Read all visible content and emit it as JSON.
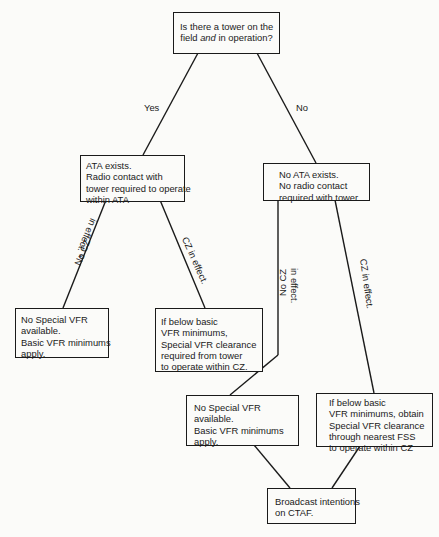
{
  "diagram": {
    "type": "decision-flowchart",
    "nodes": {
      "question": {
        "lines": [
          "Is there a tower on the",
          "field ",
          "and",
          " in operation?"
        ]
      },
      "yes_result": {
        "lines": [
          "ATA exists.",
          "Radio contact with",
          "tower required to operate",
          "within ATA"
        ]
      },
      "no_result": {
        "lines": [
          "No ATA exists.",
          "No radio contact",
          "required with tower."
        ]
      },
      "yes_no_cz": {
        "lines": [
          "No Special VFR",
          "available.",
          "Basic VFR minimums",
          "apply."
        ]
      },
      "yes_cz": {
        "lines": [
          "If below basic",
          "VFR minimums,",
          "Special VFR clearance",
          "required from tower",
          "to operate within CZ."
        ]
      },
      "no_no_cz": {
        "lines": [
          "No Special VFR",
          "available.",
          "Basic VFR minimums",
          "apply."
        ]
      },
      "no_cz": {
        "lines": [
          "If below basic",
          "VFR minimums, obtain",
          "Special VFR clearance",
          "through nearest FSS",
          "to operate within CZ"
        ]
      },
      "broadcast": {
        "lines": [
          "Broadcast intentions",
          "on CTAF."
        ]
      }
    },
    "edge_labels": {
      "yes": "Yes",
      "no": "No",
      "left_no_cz_1": "No CZ",
      "left_no_cz_2": "in effect. *",
      "left_cz": "CZ in effect.",
      "right_no_cz_1": "No CZ",
      "right_no_cz_2": "in effect.",
      "right_cz": "CZ in effect."
    },
    "colors": {
      "line": "#1a1a1a",
      "background": "#fbfbf9"
    }
  }
}
